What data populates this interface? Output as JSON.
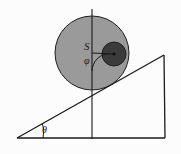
{
  "figure": {
    "kind": "mechanics-diagram",
    "caption_text": "",
    "background_color": "#fcfcfc",
    "stroke_color": "#1a1a1a",
    "labels": {
      "center_of_mass": "S",
      "angle_phi": "φ",
      "angle_theta": "θ"
    },
    "shapes": {
      "outer_disk": {
        "name": "outer-disk",
        "center_x": 92,
        "center_y": 53,
        "radius": 37,
        "fill_color": "#9a9a9a",
        "stroke_color": "#1f1f1f"
      },
      "inner_disk": {
        "name": "inner-disk",
        "center_x": 114,
        "center_y": 54,
        "radius": 12,
        "fill_color": "#3b3b3b",
        "stroke_color": "#1f1f1f"
      },
      "center_dot": {
        "name": "inner-disk-center-dot",
        "center_x": 114,
        "center_y": 54,
        "radius": 1.6,
        "fill_color": "#111111"
      },
      "vertical_axis": {
        "name": "vertical-axis-line",
        "x": 92,
        "y_top": 9,
        "y_bottom": 139
      },
      "incline_triangle": {
        "name": "incline-triangle",
        "apex_x": 164,
        "apex_y": 55,
        "left_x": 17,
        "left_y": 138,
        "right_x": 165,
        "right_y": 138
      },
      "radius_line": {
        "name": "radius-line-s-to-inner-center",
        "x1": 92,
        "y1": 53,
        "x2": 114,
        "y2": 54
      },
      "phi_arc": {
        "name": "phi-angle-arc",
        "radius": 18
      },
      "theta_arc": {
        "name": "theta-angle-arc",
        "radius": 26
      }
    },
    "label_positions": {
      "s": {
        "x": 84,
        "y": 50
      },
      "phi": {
        "x": 84,
        "y": 64
      },
      "theta": {
        "x": 42,
        "y": 133
      }
    }
  }
}
